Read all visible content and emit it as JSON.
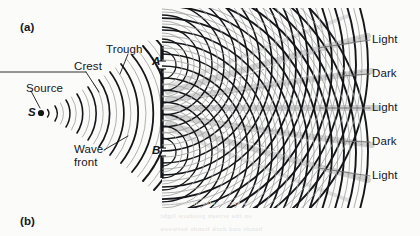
{
  "figure": {
    "domain_note": "Young double-slit interference diagram",
    "background_color": "#fbfbfa",
    "ink_color": "#15161a",
    "secondary_wave_color": "#9a9a9a",
    "band_shade_color": "#b9b9b9",
    "width": 420,
    "height": 236
  },
  "panels": [
    {
      "id": "a",
      "label": "(a)",
      "x": 20,
      "y": 21
    },
    {
      "id": "b",
      "label": "(b)",
      "x": 20,
      "y": 215
    }
  ],
  "source": {
    "callout_label": "Source",
    "callout_x": 26,
    "callout_y": 82,
    "point_label": "S",
    "point_label_x": 28,
    "point_label_y": 106,
    "point_x": 41,
    "point_y": 113
  },
  "wave_callouts": [
    {
      "label": "Crest",
      "x": 74,
      "y": 60
    },
    {
      "label": "Trough",
      "x": 106,
      "y": 43
    },
    {
      "label": "Wave",
      "x": 74,
      "y": 143,
      "label2": "front"
    }
  ],
  "barrier": {
    "x": 162,
    "top": 46,
    "bottom": 178,
    "slits": [
      {
        "id": "A",
        "label": "A",
        "label_x": 152,
        "label_y": 55,
        "y": 65
      },
      {
        "id": "B",
        "label": "B",
        "label_x": 152,
        "label_y": 144,
        "y": 152
      }
    ]
  },
  "screen": {
    "fringes": [
      {
        "label": "Light",
        "y": 40,
        "type": "bright"
      },
      {
        "label": "Dark",
        "y": 74,
        "type": "dark"
      },
      {
        "label": "Light",
        "y": 108,
        "type": "bright"
      },
      {
        "label": "Dark",
        "y": 142,
        "type": "dark"
      },
      {
        "label": "Light",
        "y": 176,
        "type": "bright"
      }
    ],
    "label_x": 372
  },
  "bleedthrough": {
    "line1": "the small notes of the wave",
    "line2": "on the screen produce light",
    "line3": "bands and dark bands between"
  }
}
